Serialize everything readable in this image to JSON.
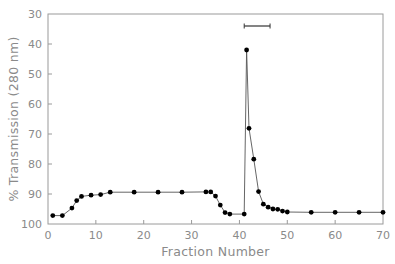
{
  "chart_data": {
    "type": "line",
    "title": "",
    "xlabel": "Fraction Number",
    "ylabel": "% Transmission (280 nm)",
    "xlim": [
      0,
      70
    ],
    "ylim": [
      100,
      30
    ],
    "y_inverted": true,
    "xticks": [
      0,
      10,
      20,
      30,
      40,
      50,
      60,
      70
    ],
    "yticks": [
      30,
      40,
      50,
      60,
      70,
      80,
      90,
      100
    ],
    "grid": false,
    "legend": null,
    "series": [
      {
        "name": "% Transmission",
        "marker": "filled-circle",
        "x": [
          1,
          3,
          5,
          6,
          7,
          9,
          11,
          13,
          18,
          23,
          28,
          33,
          34,
          35,
          36,
          37,
          38,
          41,
          41.5,
          42,
          43,
          44,
          45,
          46,
          47,
          48,
          49,
          50,
          55,
          60,
          65,
          70
        ],
        "y": [
          97.2,
          97.2,
          94.7,
          92.2,
          90.8,
          90.4,
          90.2,
          89.4,
          89.4,
          89.4,
          89.4,
          89.3,
          89.3,
          90.7,
          93.7,
          96.2,
          96.7,
          96.7,
          42,
          68.1,
          78.4,
          89.2,
          93.4,
          94.4,
          95.0,
          95.1,
          95.7,
          96.0,
          96.1,
          96.1,
          96.1,
          96.1
        ]
      }
    ],
    "annotations": [
      {
        "type": "range-bar",
        "x_start": 41,
        "x_end": 46.4,
        "y": 34,
        "description": "pooled fractions bracket"
      }
    ]
  }
}
